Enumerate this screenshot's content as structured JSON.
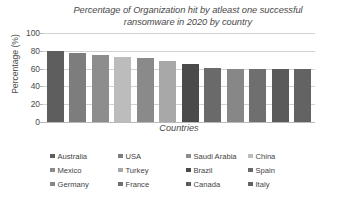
{
  "chart_data": {
    "type": "bar",
    "title": "Percentage of Organization hit by atleast one successful ransomware in 2020 by country",
    "title_line1": "Percentage of Organization hit by atleast one successful",
    "title_line2": "ransomware in 2020 by country",
    "xlabel": "Countries",
    "ylabel": "Percentage (%)",
    "ylim": [
      0,
      100
    ],
    "yticks": [
      100,
      80,
      60,
      40,
      20,
      0
    ],
    "grid": true,
    "legend_position": "bottom",
    "categories": [
      "Australia",
      "USA",
      "Saudi Arabia",
      "China",
      "Mexico",
      "Turkey",
      "Brazil",
      "Spain",
      "Germany",
      "France",
      "Canada",
      "Italy"
    ],
    "values": [
      80,
      78,
      75,
      73,
      72,
      68,
      65,
      61,
      60,
      60,
      60,
      60
    ],
    "colors": [
      "#5e5e5e",
      "#7d7d7d",
      "#8d8d8d",
      "#bcbcbc",
      "#8a8a8a",
      "#a8a8a8",
      "#4a4a4a",
      "#6a6a6a",
      "#878787",
      "#6f6f6f",
      "#5a5a5a",
      "#636363"
    ]
  },
  "legend": {
    "rows": [
      [
        {
          "label": "Australia",
          "color": "#5e5e5e"
        },
        {
          "label": "USA",
          "color": "#7d7d7d"
        },
        {
          "label": "Saudi Arabia",
          "color": "#8d8d8d"
        },
        {
          "label": "China",
          "color": "#bcbcbc"
        }
      ],
      [
        {
          "label": "Mexico",
          "color": "#8a8a8a"
        },
        {
          "label": "Turkey",
          "color": "#a8a8a8"
        },
        {
          "label": "Brazil",
          "color": "#4a4a4a"
        },
        {
          "label": "Spain",
          "color": "#6a6a6a"
        }
      ],
      [
        {
          "label": "Germany",
          "color": "#878787"
        },
        {
          "label": "France",
          "color": "#6f6f6f"
        },
        {
          "label": "Canada",
          "color": "#5a5a5a"
        },
        {
          "label": "Italy",
          "color": "#636363"
        }
      ]
    ]
  }
}
